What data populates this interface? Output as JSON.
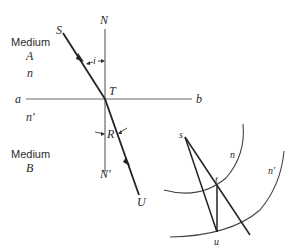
{
  "figure": {
    "labels": {
      "medium_a_title": "Medium",
      "medium_a_letter": "A",
      "n": "n",
      "n_prime": "n'",
      "medium_b_title": "Medium",
      "medium_b_letter": "B",
      "a": "a",
      "b": "b",
      "N": "N",
      "N_prime": "N'",
      "S": "S",
      "T": "T",
      "U": "U",
      "i": "i",
      "R": "R"
    },
    "construction_labels": {
      "s": "s",
      "t": "t",
      "u": "u",
      "n": "n",
      "n_prime": "n'"
    },
    "colors": {
      "ray": "#222222",
      "normal_and_interface": "#6b6b6b",
      "background": "#ffffff"
    }
  }
}
